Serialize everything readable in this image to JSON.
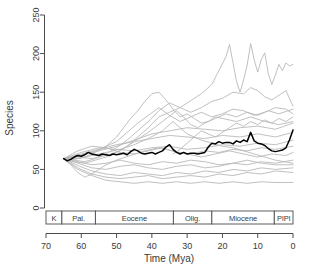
{
  "chart_data": {
    "type": "line",
    "title": "",
    "xlabel": "Time (Mya)",
    "ylabel": "Species",
    "xlim": [
      70,
      0
    ],
    "ylim": [
      0,
      250
    ],
    "x_reversed": true,
    "grid": false,
    "legend": "none",
    "xticks": [
      70,
      60,
      50,
      40,
      30,
      20,
      10,
      0
    ],
    "xticklabels": [
      "70",
      "60",
      "50",
      "40",
      "30",
      "20",
      "10",
      "0"
    ],
    "yticks": [
      0,
      50,
      100,
      150,
      200,
      250
    ],
    "yticklabels": [
      "0",
      "50",
      "100",
      "150",
      "200",
      "250"
    ],
    "epoch_axis": {
      "name": "geologic-epoch-bar",
      "segments": [
        {
          "label": "K",
          "start": 70,
          "end": 65.5
        },
        {
          "label": "Pal.",
          "start": 65.5,
          "end": 56.0
        },
        {
          "label": "Eocene",
          "start": 56.0,
          "end": 33.9
        },
        {
          "label": "Olig.",
          "start": 33.9,
          "end": 23.0
        },
        {
          "label": "Miocene",
          "start": 23.0,
          "end": 5.3
        },
        {
          "label": "PlPl",
          "start": 5.3,
          "end": 0.0
        }
      ]
    },
    "colors": {
      "focus_line": "#000000",
      "background_lines": "#b9b9b9",
      "axis": "#4d4d4d",
      "background": "#ffffff"
    },
    "series": [
      {
        "name": "focal-lineage",
        "emphasis": "focus",
        "color": "#000000",
        "x": [
          65,
          64,
          63,
          62,
          61,
          60,
          59,
          58,
          57,
          56,
          55,
          54,
          53,
          52,
          51,
          50,
          49,
          48,
          47,
          46,
          45,
          44,
          43,
          42,
          41,
          40,
          39,
          38,
          37,
          36,
          35,
          34,
          33,
          32,
          31,
          30,
          29,
          28,
          27,
          25,
          24,
          23,
          22,
          21,
          20,
          19,
          18,
          17,
          16,
          15,
          14,
          13,
          12,
          11,
          10,
          9,
          8,
          7,
          6,
          5,
          4,
          3,
          2,
          1,
          0
        ],
        "values": [
          64,
          61,
          63,
          66,
          68,
          67,
          69,
          72,
          70,
          69,
          68,
          70,
          69,
          68,
          70,
          69,
          70,
          71,
          69,
          73,
          76,
          74,
          71,
          70,
          71,
          72,
          70,
          72,
          74,
          79,
          82,
          76,
          72,
          70,
          72,
          70,
          71,
          71,
          70,
          72,
          79,
          84,
          83,
          86,
          84,
          85,
          85,
          83,
          87,
          85,
          88,
          86,
          98,
          87,
          84,
          83,
          81,
          77,
          74,
          73,
          74,
          75,
          78,
          88,
          101
        ]
      },
      {
        "name": "series-a-high-peak",
        "color": "#b9b9b9",
        "x": [
          65,
          62,
          59,
          56,
          53,
          50,
          47,
          44,
          41,
          38,
          35,
          32,
          29,
          26,
          23,
          21,
          19,
          18,
          17,
          16,
          15,
          14,
          13,
          12,
          11,
          10,
          9,
          8,
          7,
          6,
          5,
          4,
          3,
          2,
          1,
          0
        ],
        "values": [
          64,
          60,
          58,
          62,
          66,
          72,
          80,
          92,
          104,
          118,
          124,
          130,
          139,
          148,
          160,
          178,
          196,
          212,
          188,
          164,
          150,
          166,
          185,
          213,
          192,
          176,
          192,
          201,
          174,
          160,
          172,
          186,
          178,
          188,
          184,
          186
        ]
      },
      {
        "name": "series-b-rising-150",
        "color": "#b9b9b9",
        "x": [
          65,
          62,
          59,
          56,
          53,
          50,
          47,
          44,
          41,
          38,
          35,
          32,
          29,
          26,
          23,
          20,
          17,
          14,
          12,
          10,
          8,
          6,
          4,
          2,
          0
        ],
        "values": [
          64,
          62,
          60,
          64,
          70,
          78,
          88,
          100,
          112,
          126,
          136,
          130,
          124,
          130,
          138,
          142,
          150,
          148,
          156,
          152,
          144,
          140,
          146,
          152,
          132
        ]
      },
      {
        "name": "series-c-mid-130",
        "color": "#b9b9b9",
        "x": [
          65,
          62,
          59,
          56,
          53,
          50,
          47,
          44,
          41,
          38,
          35,
          32,
          29,
          26,
          23,
          20,
          17,
          14,
          11,
          8,
          5,
          2,
          0
        ],
        "values": [
          64,
          66,
          70,
          74,
          80,
          86,
          98,
          110,
          120,
          130,
          120,
          112,
          118,
          124,
          118,
          122,
          128,
          126,
          120,
          124,
          130,
          128,
          122
        ]
      },
      {
        "name": "series-d-eocene-peak",
        "color": "#b9b9b9",
        "x": [
          65,
          62,
          59,
          56,
          53,
          50,
          48,
          46,
          44,
          42,
          40,
          38,
          36,
          34,
          32,
          30,
          28,
          26,
          24,
          22,
          20,
          16,
          12,
          8,
          4,
          0
        ],
        "values": [
          64,
          63,
          66,
          72,
          80,
          92,
          104,
          116,
          126,
          138,
          148,
          150,
          140,
          128,
          118,
          122,
          116,
          110,
          112,
          118,
          116,
          112,
          118,
          112,
          108,
          112
        ]
      },
      {
        "name": "series-e-flat-110",
        "color": "#b9b9b9",
        "x": [
          65,
          60,
          55,
          50,
          45,
          40,
          35,
          30,
          25,
          20,
          15,
          10,
          5,
          0
        ],
        "values": [
          64,
          68,
          74,
          80,
          88,
          96,
          100,
          104,
          102,
          100,
          104,
          106,
          102,
          110
        ]
      },
      {
        "name": "series-f-gentle-100",
        "color": "#b9b9b9",
        "x": [
          65,
          60,
          55,
          50,
          45,
          40,
          35,
          30,
          25,
          20,
          15,
          10,
          5,
          0
        ],
        "values": [
          64,
          70,
          76,
          82,
          86,
          90,
          94,
          92,
          90,
          94,
          92,
          96,
          92,
          98
        ]
      },
      {
        "name": "series-g-mid-85",
        "color": "#b9b9b9",
        "x": [
          65,
          60,
          55,
          50,
          45,
          40,
          35,
          30,
          25,
          20,
          15,
          10,
          5,
          0
        ],
        "values": [
          64,
          72,
          78,
          76,
          74,
          78,
          80,
          76,
          78,
          82,
          80,
          84,
          82,
          88
        ]
      },
      {
        "name": "series-h-flat-80",
        "color": "#b9b9b9",
        "x": [
          65,
          61,
          57,
          53,
          49,
          45,
          41,
          37,
          33,
          29,
          25,
          21,
          17,
          13,
          9,
          5,
          0
        ],
        "values": [
          64,
          74,
          80,
          78,
          72,
          70,
          74,
          78,
          72,
          70,
          74,
          72,
          76,
          74,
          78,
          76,
          80
        ]
      },
      {
        "name": "series-i-decline-60",
        "color": "#b9b9b9",
        "x": [
          65,
          61,
          57,
          53,
          49,
          45,
          41,
          37,
          33,
          29,
          25,
          21,
          17,
          13,
          9,
          5,
          0
        ],
        "values": [
          64,
          58,
          52,
          50,
          54,
          56,
          52,
          50,
          54,
          56,
          52,
          54,
          58,
          56,
          60,
          58,
          62
        ]
      },
      {
        "name": "series-j-low-50",
        "color": "#b9b9b9",
        "x": [
          65,
          61,
          57,
          53,
          49,
          45,
          41,
          37,
          33,
          29,
          25,
          21,
          17,
          13,
          9,
          5,
          0
        ],
        "values": [
          64,
          55,
          48,
          44,
          42,
          46,
          44,
          42,
          46,
          44,
          48,
          46,
          50,
          48,
          52,
          50,
          52
        ]
      },
      {
        "name": "series-k-low-45",
        "color": "#b9b9b9",
        "x": [
          65,
          61,
          57,
          53,
          49,
          45,
          41,
          37,
          33,
          29,
          25,
          21,
          17,
          13,
          9,
          5,
          0
        ],
        "values": [
          64,
          52,
          44,
          40,
          38,
          40,
          42,
          38,
          40,
          42,
          40,
          44,
          42,
          46,
          44,
          48,
          46
        ]
      },
      {
        "name": "series-l-lowest-33",
        "color": "#b9b9b9",
        "x": [
          65,
          61,
          57,
          53,
          49,
          45,
          41,
          37,
          33,
          29,
          25,
          21,
          17,
          13,
          9,
          5,
          0
        ],
        "values": [
          64,
          50,
          42,
          36,
          34,
          32,
          34,
          32,
          34,
          32,
          34,
          32,
          34,
          32,
          34,
          33,
          33
        ]
      },
      {
        "name": "series-m-midlow-55",
        "color": "#b9b9b9",
        "x": [
          65,
          61,
          57,
          53,
          49,
          45,
          41,
          37,
          33,
          29,
          25,
          21,
          17,
          13,
          9,
          5,
          0
        ],
        "values": [
          64,
          60,
          56,
          58,
          62,
          58,
          56,
          60,
          58,
          62,
          60,
          56,
          58,
          62,
          58,
          56,
          56
        ]
      },
      {
        "name": "series-n-eocene-climb",
        "color": "#b9b9b9",
        "x": [
          65,
          61,
          57,
          53,
          49,
          45,
          41,
          37,
          33,
          31,
          29,
          27,
          25,
          22,
          19,
          16,
          13,
          10,
          7,
          4,
          0
        ],
        "values": [
          64,
          66,
          64,
          68,
          74,
          86,
          98,
          112,
          126,
          118,
          108,
          104,
          110,
          116,
          122,
          118,
          124,
          120,
          126,
          122,
          128
        ]
      },
      {
        "name": "series-o-olig-dip",
        "color": "#b9b9b9",
        "x": [
          65,
          61,
          57,
          53,
          49,
          45,
          41,
          37,
          34,
          32,
          30,
          28,
          26,
          23,
          20,
          17,
          14,
          11,
          8,
          5,
          0
        ],
        "values": [
          64,
          64,
          68,
          72,
          76,
          82,
          90,
          100,
          112,
          104,
          96,
          92,
          88,
          84,
          80,
          78,
          74,
          70,
          66,
          62,
          58
        ]
      },
      {
        "name": "series-p-early-dip",
        "color": "#b9b9b9",
        "x": [
          65,
          63,
          61,
          59,
          57,
          55,
          53,
          50,
          46,
          42,
          38,
          34,
          30,
          26,
          22,
          18,
          14,
          10,
          6,
          2,
          0
        ],
        "values": [
          64,
          56,
          46,
          40,
          44,
          50,
          56,
          62,
          68,
          74,
          78,
          74,
          70,
          66,
          70,
          74,
          70,
          66,
          70,
          68,
          72
        ]
      },
      {
        "name": "series-q-olig-to-recent",
        "color": "#b9b9b9",
        "x": [
          34,
          32,
          30,
          28,
          26,
          24,
          22,
          20,
          18,
          16,
          14,
          12,
          10,
          8,
          6,
          4,
          2,
          0
        ],
        "values": [
          70,
          76,
          84,
          92,
          100,
          96,
          92,
          98,
          104,
          110,
          106,
          112,
          108,
          114,
          110,
          116,
          112,
          118
        ]
      }
    ]
  },
  "axes_labels": {
    "x_title": "Time (Mya)",
    "y_title": "Species"
  }
}
